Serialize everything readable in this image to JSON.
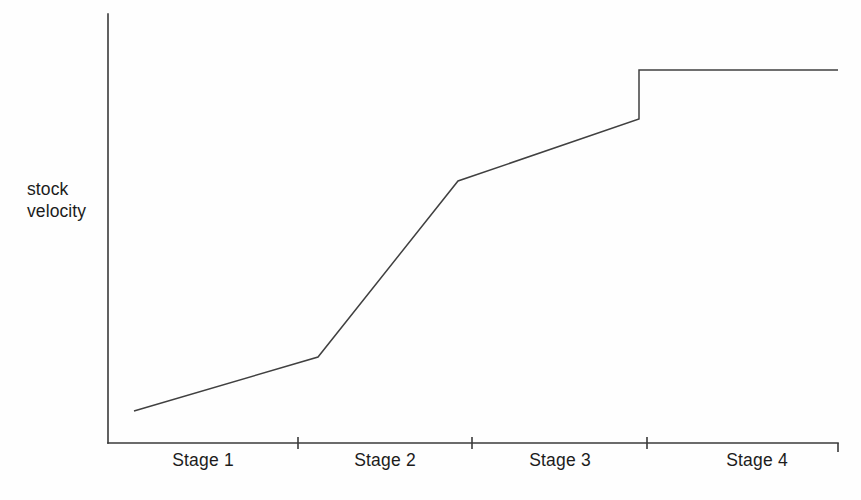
{
  "chart_data": {
    "type": "line",
    "title": "",
    "subtitle": "",
    "xlabel": "",
    "ylabel": "stock\nvelocity",
    "ylabel_line1": "stock",
    "ylabel_line2": "velocity",
    "categories": [
      "Stage 1",
      "Stage 2",
      "Stage 3",
      "Stage 4"
    ],
    "tick_labels": [
      "Stage 1",
      "Stage 2",
      "Stage 3",
      "Stage 4"
    ],
    "grid": false,
    "legend": null,
    "legend_position": "none",
    "axes": {
      "x_axis_visible": true,
      "y_axis_visible": true,
      "x_tick_marks_at_stage_boundaries": true,
      "x_ticks_count": 3,
      "y_ticks_count": 0,
      "xlim": [
        0,
        1
      ],
      "ylim": [
        0,
        1
      ],
      "tick_values_shown": false
    },
    "annotations": [],
    "series": [
      {
        "name": "stock velocity",
        "color": "#404040",
        "points": [
          {
            "x": 0.045,
            "y": 0.075,
            "stage": "Stage 1",
            "note": "start"
          },
          {
            "x": 0.288,
            "y": 0.2,
            "stage": "Stage 1",
            "note": "end of slow rise / kink"
          },
          {
            "x": 0.479,
            "y": 0.612,
            "stage": "Stage 2",
            "note": "end of steep rise / kink"
          },
          {
            "x": 0.727,
            "y": 0.756,
            "stage": "Stage 3",
            "note": "pre-step"
          },
          {
            "x": 0.727,
            "y": 0.869,
            "stage": "Stage 3",
            "note": "post-step (vertical jump)"
          },
          {
            "x": 1.0,
            "y": 0.869,
            "stage": "Stage 4",
            "note": "plateau end"
          }
        ]
      }
    ],
    "colors": {
      "line": "#404040",
      "axis": "#3a3a3a",
      "text": "#1c1c1c",
      "background": "#fefefe"
    }
  },
  "axis_geometry": {
    "y_axis": {
      "x": 108,
      "y_top": 14,
      "y_bottom": 443
    },
    "x_axis": {
      "y": 443,
      "x_left": 108,
      "x_right": 838
    },
    "x_end_tick": {
      "x": 838,
      "y_from": 443,
      "y_to": 452
    },
    "ticks": [
      {
        "x": 298,
        "y_from": 437,
        "y_to": 449
      },
      {
        "x": 472,
        "y_from": 437,
        "y_to": 449
      },
      {
        "x": 647,
        "y_from": 437,
        "y_to": 449
      }
    ],
    "series_pixel_points": [
      {
        "x": 134,
        "y": 411
      },
      {
        "x": 318,
        "y": 357
      },
      {
        "x": 458,
        "y": 181
      },
      {
        "x": 639,
        "y": 119
      },
      {
        "x": 639,
        "y": 70
      },
      {
        "x": 838,
        "y": 70
      }
    ],
    "tick_label_centers": [
      203,
      385,
      560,
      757
    ]
  }
}
